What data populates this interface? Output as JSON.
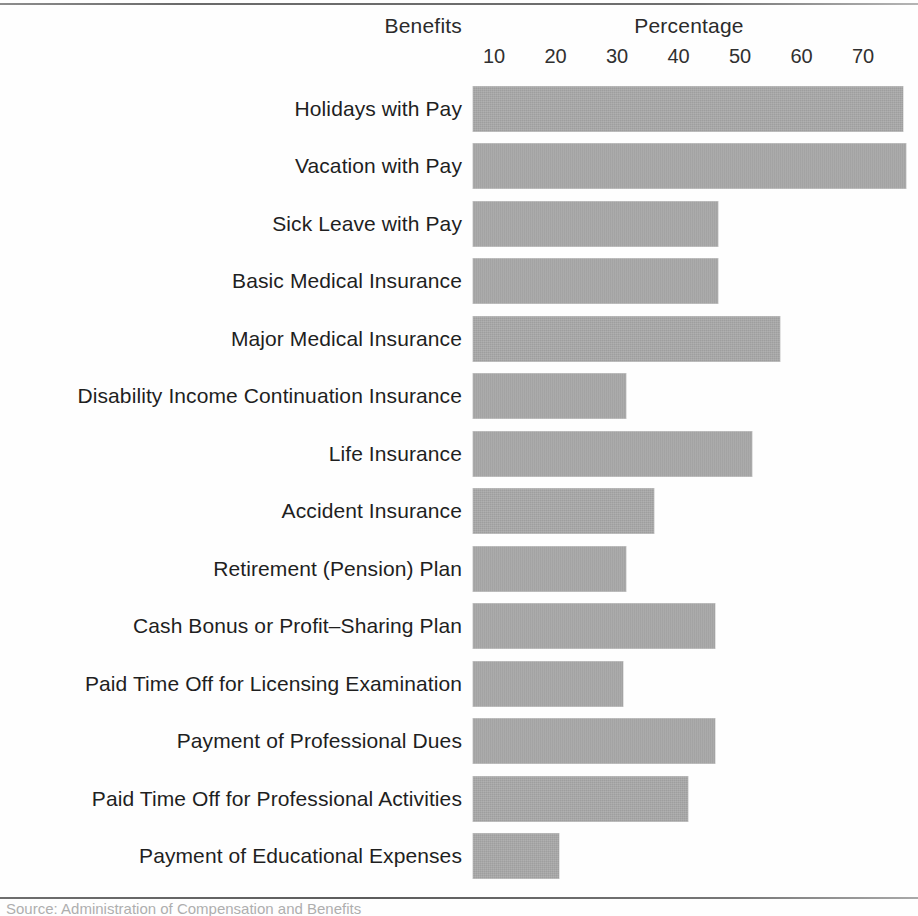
{
  "figure": {
    "header_left": "Benefits",
    "header_right": "Percentage",
    "caption": "Source: Administration of Compensation and Benefits"
  },
  "chart_data": {
    "type": "bar",
    "orientation": "horizontal",
    "title": "Percentage",
    "xlabel": "Percentage",
    "ylabel": "Benefits",
    "xlim": [
      0,
      78
    ],
    "grid": false,
    "legend": null,
    "bar_color": "#a8a8a8",
    "tick_values": [
      10,
      20,
      30,
      40,
      50,
      60,
      70
    ],
    "tick_labels": [
      "10",
      "20",
      "30",
      "40",
      "50",
      "60",
      "70"
    ],
    "categories": [
      "Holidays with Pay",
      "Vacation with Pay",
      "Sick Leave with Pay",
      "Basic Medical Insurance",
      "Major Medical Insurance",
      "Disability Income Continuation Insurance",
      "Life Insurance",
      "Accident Insurance",
      "Retirement (Pension) Plan",
      "Cash Bonus or Profit–Sharing Plan",
      "Paid Time Off for Licensing Examination",
      "Payment of Professional Dues",
      "Paid Time Off for Professional Activities",
      "Payment of Educational Expenses"
    ],
    "values": [
      76.5,
      77,
      46.5,
      46.5,
      56.5,
      31.5,
      52,
      36,
      31.5,
      46,
      31,
      46,
      41.5,
      20.5
    ]
  }
}
